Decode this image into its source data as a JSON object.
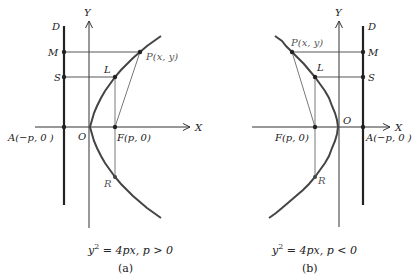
{
  "figures": [
    {
      "id": "a",
      "axis_x_label": "X",
      "axis_y_label": "Y",
      "directrix_label": "D",
      "origin_label": "O",
      "point_P": "P(x, y)",
      "point_L": "L",
      "point_R": "R",
      "point_M": "M",
      "point_S": "S",
      "point_F": "F(p, 0)",
      "point_A": "A(−p, 0 )",
      "equation_lhs": "y",
      "equation_exp": "2",
      "equation_rhs": " = 4px, p > 0",
      "caption": "(a)"
    },
    {
      "id": "b",
      "axis_x_label": "X",
      "axis_y_label": "Y",
      "directrix_label": "D",
      "origin_label": "O",
      "point_P": "P(x, y)",
      "point_L": "L",
      "point_R": "R",
      "point_M": "M",
      "point_S": "S",
      "point_F": "F(p, 0)",
      "point_A": "A(−p, 0 )",
      "equation_lhs": "y",
      "equation_exp": "2",
      "equation_rhs": " = 4px, p < 0",
      "caption": "(b)"
    }
  ],
  "colors": {
    "curve": "#444444",
    "axis": "#333333",
    "directrix": "#222222",
    "construction": "#555555"
  }
}
